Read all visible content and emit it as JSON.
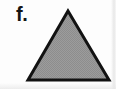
{
  "figure": {
    "canvas_width": 116,
    "canvas_height": 89,
    "background_color": "#fdfdfd",
    "panel_label": "f.",
    "label_color": "#141414"
  },
  "shape": {
    "name": "triangle",
    "kind": "isosceles-triangle",
    "apex": {
      "x": 68,
      "y": 11
    },
    "base_left": {
      "x": 28,
      "y": 80
    },
    "base_right": {
      "x": 109,
      "y": 80
    },
    "fill_color": "#9a9a9a",
    "fill_style": "dithered-gray-halftone",
    "stroke_color": "#121212",
    "stroke_width": 3
  },
  "artifacts": {
    "right_edge_tint": "#e4e4e4",
    "bottom_edge_tint": "#e8e8e8"
  }
}
